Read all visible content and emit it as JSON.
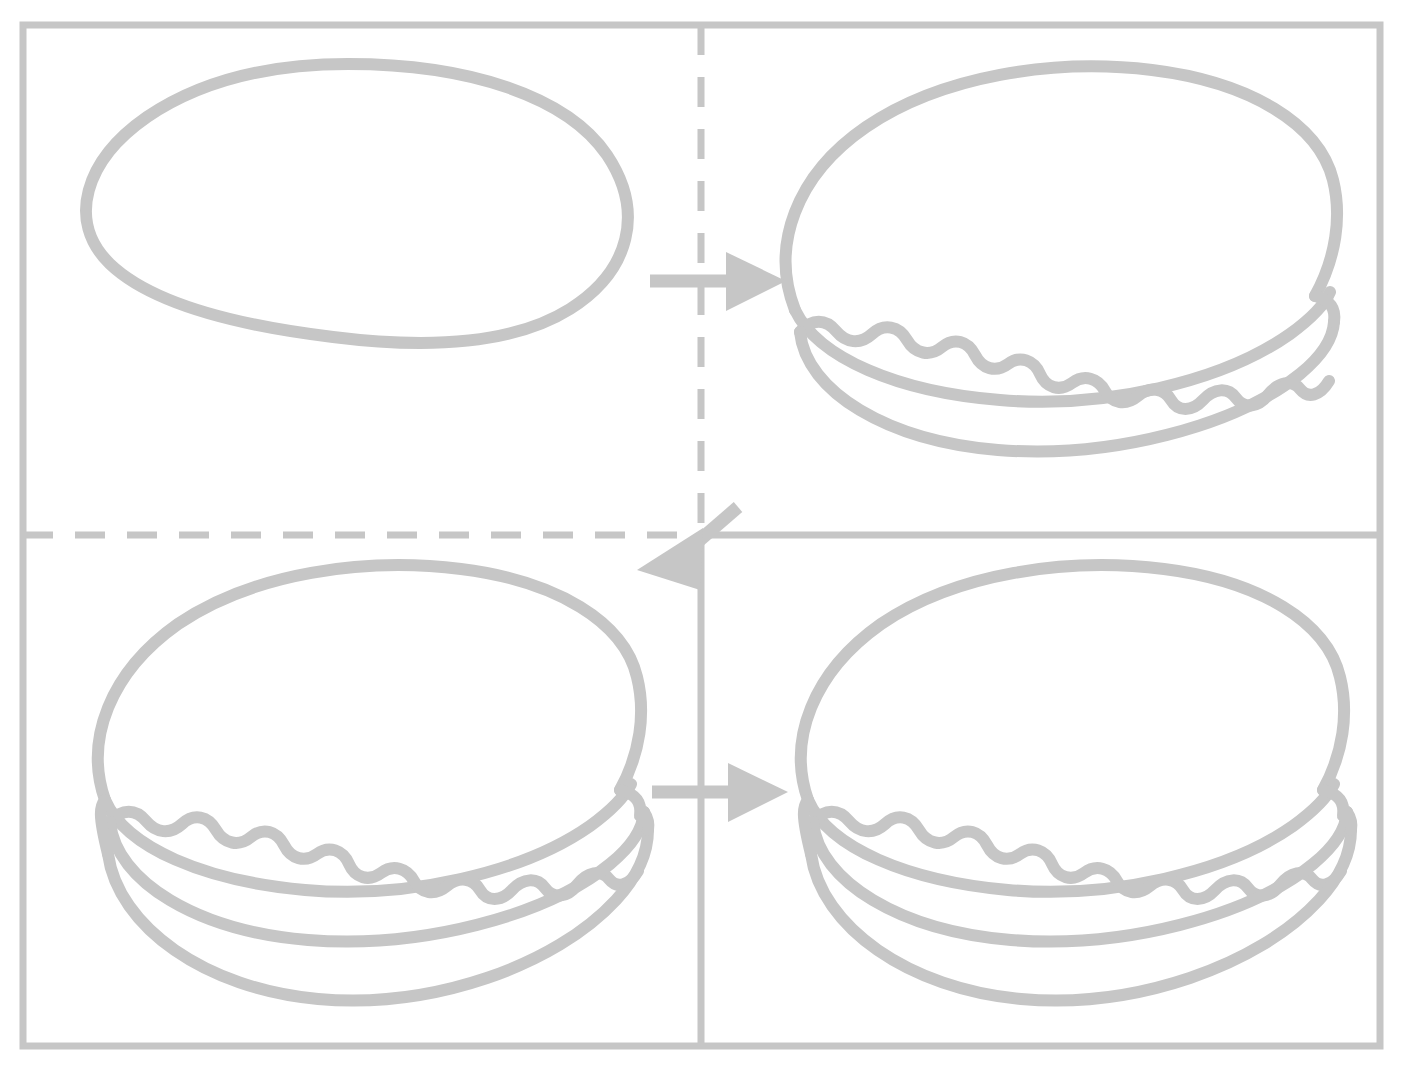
{
  "canvas": {
    "width": 1403,
    "height": 1071,
    "background": "#ffffff",
    "stroke_color": "#c6c6c6",
    "title": "Hamburger assembly sequence diagram"
  },
  "frame": {
    "name": "outer-rectangle",
    "x": 23,
    "y": 25,
    "width": 1357,
    "height": 1021,
    "stroke_width": 7,
    "style": "solid"
  },
  "dividers": [
    {
      "name": "vertical-divider-upper",
      "orientation": "vertical",
      "style": "dashed",
      "x": 701,
      "y1": 25,
      "y2": 535
    },
    {
      "name": "horizontal-divider-left",
      "orientation": "horizontal",
      "style": "dashed",
      "y": 535,
      "x1": 23,
      "x2": 701
    },
    {
      "name": "horizontal-divider-right",
      "orientation": "horizontal",
      "style": "solid",
      "y": 535,
      "x1": 701,
      "x2": 1380
    },
    {
      "name": "vertical-divider-lower",
      "orientation": "vertical",
      "style": "solid",
      "x": 701,
      "y1": 535,
      "y2": 1046
    }
  ],
  "arrows": [
    {
      "name": "arrow-step1-to-step2",
      "direction": "right",
      "from_panel": "top-left",
      "to_panel": "top-right",
      "x1": 650,
      "y1": 281,
      "x2": 740,
      "y2": 281,
      "head_size": 34
    },
    {
      "name": "arrow-step2-to-step3",
      "direction": "down-left-diagonal",
      "from_panel": "top-right",
      "to_panel": "bottom-left",
      "x1": 740,
      "y1": 508,
      "x2": 655,
      "y2": 580,
      "head_size": 36
    },
    {
      "name": "arrow-step3-to-step4",
      "direction": "right",
      "from_panel": "bottom-left",
      "to_panel": "bottom-right",
      "x1": 652,
      "y1": 792,
      "x2": 742,
      "y2": 792,
      "head_size": 34
    }
  ],
  "panels": [
    {
      "name": "panel-top-left",
      "step": 1,
      "label": "plain-bun-oval",
      "description": "Empty oval outline – top bun only",
      "layers": [
        "bun-outline"
      ],
      "center_x": 352,
      "center_y": 203
    },
    {
      "name": "panel-top-right",
      "step": 2,
      "label": "bun-with-lettuce",
      "description": "Bun dome with patty line and wavy lettuce edge",
      "layers": [
        "bun-dome",
        "patty-line",
        "lettuce-wave",
        "lower-arc"
      ],
      "center_x": 1055,
      "center_y": 260
    },
    {
      "name": "panel-bottom-left",
      "step": 3,
      "label": "full-burger",
      "description": "Bun dome, patty line, lettuce wave, bottom bun and base arc",
      "layers": [
        "bun-dome",
        "patty-line",
        "lettuce-wave",
        "bottom-bun-line",
        "base-arc"
      ],
      "center_x": 352,
      "center_y": 790
    },
    {
      "name": "panel-bottom-right",
      "step": 4,
      "label": "full-burger-final",
      "description": "Completed burger identical to step 3",
      "layers": [
        "bun-dome",
        "patty-line",
        "lettuce-wave",
        "bottom-bun-line",
        "base-arc"
      ],
      "center_x": 1055,
      "center_y": 790
    }
  ],
  "chart_data": {
    "type": "diagram",
    "steps": [
      {
        "index": 1,
        "panel": "top-left",
        "name": "Empty bun oval",
        "layer_count": 1
      },
      {
        "index": 2,
        "panel": "top-right",
        "name": "Bun with lettuce",
        "layer_count": 4
      },
      {
        "index": 3,
        "panel": "bottom-left",
        "name": "Full burger",
        "layer_count": 5
      },
      {
        "index": 4,
        "panel": "bottom-right",
        "name": "Completed burger",
        "layer_count": 5
      }
    ],
    "flow": [
      "top-left",
      "top-right",
      "bottom-left",
      "bottom-right"
    ],
    "legend": [],
    "grid": true
  }
}
